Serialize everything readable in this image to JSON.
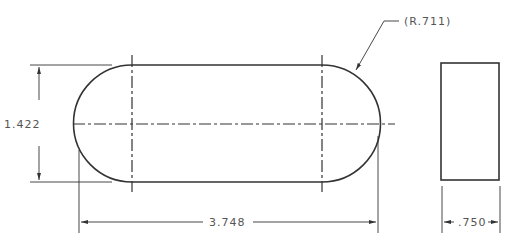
{
  "drawing": {
    "type": "engineering-drawing",
    "views": [
      "front-view-slot",
      "side-view-rectangle"
    ],
    "dimensions": {
      "radius_label": "(R.711)",
      "height_label": "1.422",
      "length_label": "3.748",
      "thickness_label": ".750"
    },
    "colors": {
      "line": "#333333",
      "text": "#555555",
      "background": "#ffffff"
    }
  }
}
